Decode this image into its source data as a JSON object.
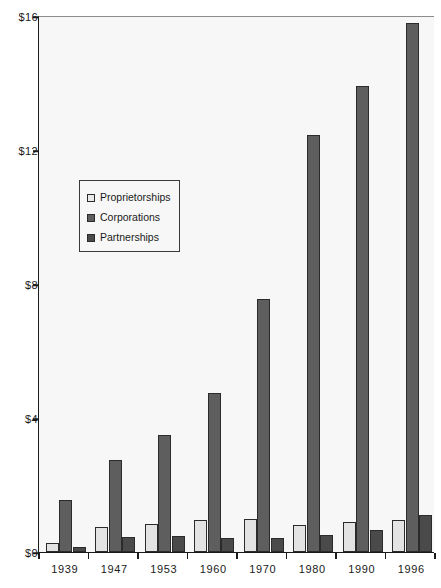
{
  "chart_data": {
    "type": "bar",
    "title": "",
    "xlabel": "",
    "ylabel": "",
    "categories": [
      "1939",
      "1947",
      "1953",
      "1960",
      "1970",
      "1980",
      "1990",
      "1996"
    ],
    "series": [
      {
        "name": "Proprietorships",
        "color": "#e3e3e3",
        "values": [
          0.27,
          0.75,
          0.85,
          0.95,
          1.0,
          0.8,
          0.9,
          0.95
        ]
      },
      {
        "name": "Corporations",
        "color": "#5e5e5e",
        "values": [
          1.55,
          2.75,
          3.5,
          4.75,
          7.55,
          12.45,
          13.9,
          15.8
        ]
      },
      {
        "name": "Partnerships",
        "color": "#4a4a4a",
        "values": [
          0.15,
          0.45,
          0.48,
          0.42,
          0.42,
          0.52,
          0.65,
          1.1
        ]
      }
    ],
    "ylim": [
      0,
      16
    ],
    "yticks": [
      0,
      4,
      8,
      12,
      16
    ],
    "ytick_labels": [
      "$0",
      "$4",
      "$8",
      "$12",
      "$16"
    ],
    "grid": false,
    "legend_position": "inside-left"
  },
  "legend": {
    "items": [
      {
        "label": "Proprietorships"
      },
      {
        "label": "Corporations"
      },
      {
        "label": "Partnerships"
      }
    ]
  }
}
